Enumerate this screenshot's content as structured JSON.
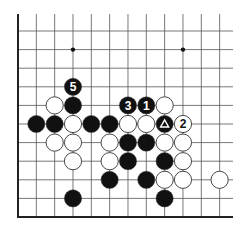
{
  "diagram": {
    "type": "go-board-problem",
    "grid": {
      "origin_x": 18,
      "origin_y": 31,
      "dx": 18.33,
      "dy": 18.6,
      "columns": 12,
      "rows": 10,
      "top_edge_y": 14,
      "right_edge_x": 233,
      "bottom_edge_y": 217,
      "edges": [
        "left",
        "bottom"
      ]
    },
    "colors": {
      "line": "#555555",
      "edge": "#222222",
      "black_stone": "#111111",
      "white_stone": "#ffffff",
      "stone_outline": "#333333"
    },
    "star_points": [
      {
        "col": 3,
        "row": 1
      },
      {
        "col": 9,
        "row": 1
      }
    ],
    "stones": [
      {
        "col": 3,
        "row": 3,
        "color": "black",
        "label": "5"
      },
      {
        "col": 2,
        "row": 4,
        "color": "white",
        "label": ""
      },
      {
        "col": 3,
        "row": 4,
        "color": "black",
        "label": ""
      },
      {
        "col": 6,
        "row": 4,
        "color": "black",
        "label": "3"
      },
      {
        "col": 7,
        "row": 4,
        "color": "black",
        "label": "1"
      },
      {
        "col": 8,
        "row": 4,
        "color": "white",
        "label": ""
      },
      {
        "col": 1,
        "row": 5,
        "color": "black",
        "label": ""
      },
      {
        "col": 2,
        "row": 5,
        "color": "black",
        "label": ""
      },
      {
        "col": 3,
        "row": 5,
        "color": "white",
        "label": ""
      },
      {
        "col": 4,
        "row": 5,
        "color": "black",
        "label": ""
      },
      {
        "col": 5,
        "row": 5,
        "color": "black",
        "label": ""
      },
      {
        "col": 6,
        "row": 5,
        "color": "white",
        "label": ""
      },
      {
        "col": 7,
        "row": 5,
        "color": "white",
        "label": ""
      },
      {
        "col": 8,
        "row": 5,
        "color": "black",
        "label": "",
        "marker": "triangle"
      },
      {
        "col": 9,
        "row": 5,
        "color": "white",
        "label": "2"
      },
      {
        "col": 2,
        "row": 6,
        "color": "white",
        "label": ""
      },
      {
        "col": 3,
        "row": 6,
        "color": "white",
        "label": ""
      },
      {
        "col": 5,
        "row": 6,
        "color": "white",
        "label": ""
      },
      {
        "col": 6,
        "row": 6,
        "color": "black",
        "label": ""
      },
      {
        "col": 7,
        "row": 6,
        "color": "black",
        "label": ""
      },
      {
        "col": 8,
        "row": 6,
        "color": "white",
        "label": ""
      },
      {
        "col": 9,
        "row": 6,
        "color": "white",
        "label": ""
      },
      {
        "col": 3,
        "row": 7,
        "color": "white",
        "label": ""
      },
      {
        "col": 5,
        "row": 7,
        "color": "white",
        "label": ""
      },
      {
        "col": 6,
        "row": 7,
        "color": "black",
        "label": ""
      },
      {
        "col": 8,
        "row": 7,
        "color": "black",
        "label": ""
      },
      {
        "col": 9,
        "row": 7,
        "color": "white",
        "label": ""
      },
      {
        "col": 5,
        "row": 8,
        "color": "black",
        "label": ""
      },
      {
        "col": 7,
        "row": 8,
        "color": "black",
        "label": ""
      },
      {
        "col": 8,
        "row": 8,
        "color": "white",
        "label": ""
      },
      {
        "col": 9,
        "row": 8,
        "color": "white",
        "label": ""
      },
      {
        "col": 11,
        "row": 8,
        "color": "white",
        "label": ""
      },
      {
        "col": 3,
        "row": 9,
        "color": "black",
        "label": ""
      },
      {
        "col": 8,
        "row": 9,
        "color": "black",
        "label": ""
      }
    ]
  }
}
